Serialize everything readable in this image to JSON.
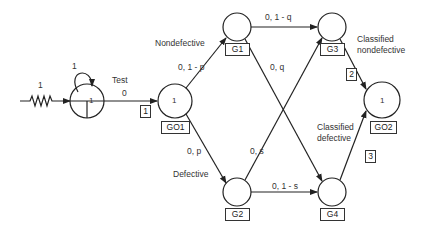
{
  "diagram": {
    "type": "stochastic petri net / state transition",
    "source": {
      "weight_label": "1",
      "loop_label": "1",
      "token": "1"
    },
    "test": {
      "title": "Test",
      "rate": "0",
      "index": "1"
    },
    "nodes": {
      "GO1": {
        "label": "GO1",
        "token": "1"
      },
      "G1": {
        "label": "G1"
      },
      "G2": {
        "label": "G2"
      },
      "G3": {
        "label": "G3"
      },
      "G4": {
        "label": "G4"
      },
      "GO2": {
        "label": "GO2",
        "token": "1"
      }
    },
    "edges": {
      "go1_g1": "0, 1 - p",
      "go1_g2": "0, p",
      "g1_g3": "0, 1 - q",
      "g1_g4": "0, q",
      "g2_g3": "0, s",
      "g2_g4": "0, 1 - s"
    },
    "labels": {
      "nondefective": "Nondefective",
      "defective": "Defective",
      "classified_nondefective_1": "Classified",
      "classified_nondefective_2": "nondefective",
      "classified_defective_1": "Classified",
      "classified_defective_2": "defective"
    },
    "transition_indices": {
      "t2": "2",
      "t3": "3"
    }
  }
}
